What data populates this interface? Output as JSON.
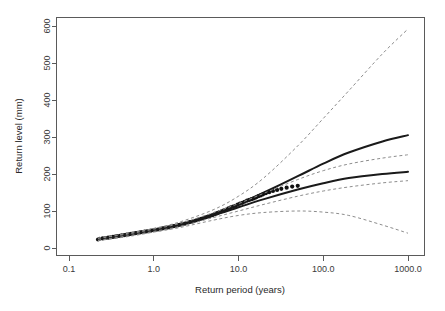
{
  "chart_data": {
    "type": "scatter",
    "title": "",
    "xlabel": "Return period (years)",
    "ylabel": "Return level (mm)",
    "xscale": "log",
    "yscale": "linear",
    "xlim": [
      0.1,
      1000.0
    ],
    "ylim": [
      0,
      620
    ],
    "xticks": [
      0.1,
      1.0,
      10.0,
      100.0,
      1000.0
    ],
    "xticklabels": [
      "0.1",
      "1.0",
      "10.0",
      "100.0",
      "1000.0"
    ],
    "yticks": [
      0,
      100,
      200,
      300,
      400,
      500,
      600
    ],
    "yticklabels": [
      "0",
      "100",
      "200",
      "300",
      "400",
      "500",
      "600"
    ],
    "grid": false,
    "legend": null,
    "box": true,
    "series": [
      {
        "name": "Empirical return levels",
        "type": "scatter",
        "marker": "filled-circle",
        "color": "#101010",
        "points": [
          [
            0.22,
            23
          ],
          [
            0.23,
            25
          ],
          [
            0.25,
            26
          ],
          [
            0.27,
            27
          ],
          [
            0.29,
            28
          ],
          [
            0.31,
            29
          ],
          [
            0.33,
            30
          ],
          [
            0.35,
            31
          ],
          [
            0.37,
            32
          ],
          [
            0.4,
            33
          ],
          [
            0.42,
            34
          ],
          [
            0.45,
            35
          ],
          [
            0.48,
            36
          ],
          [
            0.51,
            37
          ],
          [
            0.54,
            38
          ],
          [
            0.57,
            39
          ],
          [
            0.61,
            40
          ],
          [
            0.65,
            41
          ],
          [
            0.69,
            42
          ],
          [
            0.73,
            43
          ],
          [
            0.78,
            44
          ],
          [
            0.83,
            45
          ],
          [
            0.88,
            46
          ],
          [
            0.93,
            47
          ],
          [
            0.99,
            48
          ],
          [
            1.05,
            49
          ],
          [
            1.12,
            50
          ],
          [
            1.19,
            51
          ],
          [
            1.27,
            53
          ],
          [
            1.35,
            54
          ],
          [
            1.43,
            55
          ],
          [
            1.52,
            56
          ],
          [
            1.62,
            58
          ],
          [
            1.72,
            59
          ],
          [
            1.83,
            60
          ],
          [
            1.95,
            62
          ],
          [
            2.07,
            63
          ],
          [
            2.2,
            65
          ],
          [
            2.34,
            66
          ],
          [
            2.49,
            68
          ],
          [
            2.65,
            70
          ],
          [
            2.82,
            71
          ],
          [
            3.0,
            73
          ],
          [
            3.19,
            75
          ],
          [
            3.4,
            77
          ],
          [
            3.62,
            79
          ],
          [
            3.85,
            81
          ],
          [
            4.1,
            83
          ],
          [
            4.36,
            85
          ],
          [
            4.64,
            87
          ],
          [
            4.94,
            89
          ],
          [
            5.25,
            92
          ],
          [
            5.59,
            94
          ],
          [
            5.95,
            97
          ],
          [
            6.33,
            99
          ],
          [
            6.74,
            102
          ],
          [
            7.17,
            104
          ],
          [
            7.63,
            107
          ],
          [
            8.12,
            110
          ],
          [
            8.64,
            112
          ],
          [
            9.2,
            114
          ],
          [
            9.79,
            117
          ],
          [
            10.4,
            120
          ],
          [
            11.1,
            122
          ],
          [
            11.8,
            125
          ],
          [
            12.6,
            128
          ],
          [
            13.4,
            130
          ],
          [
            14.3,
            132
          ],
          [
            15.2,
            134
          ],
          [
            16.2,
            137
          ],
          [
            17.2,
            140
          ],
          [
            18.3,
            142
          ],
          [
            19.5,
            145
          ],
          [
            21.0,
            148
          ],
          [
            23.0,
            151
          ],
          [
            25.5,
            154
          ],
          [
            28.5,
            157
          ],
          [
            32.0,
            160
          ],
          [
            37.0,
            163
          ],
          [
            43.0,
            166
          ],
          [
            50.0,
            168
          ]
        ]
      },
      {
        "name": "Fitted return level (model A)",
        "type": "line",
        "style": "solid",
        "color": "#1a1a1a",
        "points": [
          [
            0.22,
            24
          ],
          [
            0.5,
            36
          ],
          [
            1.0,
            48
          ],
          [
            2.0,
            62
          ],
          [
            5.0,
            90
          ],
          [
            10.0,
            118
          ],
          [
            20.0,
            150
          ],
          [
            50.0,
            194
          ],
          [
            100.0,
            228
          ],
          [
            200.0,
            258
          ],
          [
            500.0,
            288
          ],
          [
            1000.0,
            305
          ]
        ]
      },
      {
        "name": "Fitted return level (model B)",
        "type": "line",
        "style": "solid",
        "color": "#1a1a1a",
        "points": [
          [
            0.22,
            24
          ],
          [
            0.5,
            36
          ],
          [
            1.0,
            48
          ],
          [
            2.0,
            62
          ],
          [
            5.0,
            88
          ],
          [
            10.0,
            110
          ],
          [
            20.0,
            132
          ],
          [
            50.0,
            158
          ],
          [
            100.0,
            175
          ],
          [
            200.0,
            189
          ],
          [
            500.0,
            200
          ],
          [
            1000.0,
            206
          ]
        ]
      },
      {
        "name": "Upper confidence limit (outer)",
        "type": "line",
        "style": "dashed",
        "color": "#8d8d8d",
        "points": [
          [
            0.22,
            27
          ],
          [
            0.5,
            40
          ],
          [
            1.0,
            53
          ],
          [
            2.0,
            70
          ],
          [
            5.0,
            103
          ],
          [
            10.0,
            140
          ],
          [
            20.0,
            190
          ],
          [
            50.0,
            276
          ],
          [
            100.0,
            350
          ],
          [
            200.0,
            425
          ],
          [
            500.0,
            525
          ],
          [
            1000.0,
            592
          ]
        ]
      },
      {
        "name": "Upper confidence limit (inner)",
        "type": "line",
        "style": "dashed",
        "color": "#8d8d8d",
        "points": [
          [
            0.22,
            26
          ],
          [
            0.5,
            38
          ],
          [
            1.0,
            51
          ],
          [
            2.0,
            66
          ],
          [
            5.0,
            95
          ],
          [
            10.0,
            120
          ],
          [
            20.0,
            148
          ],
          [
            50.0,
            185
          ],
          [
            100.0,
            209
          ],
          [
            200.0,
            227
          ],
          [
            500.0,
            243
          ],
          [
            1000.0,
            252
          ]
        ]
      },
      {
        "name": "Lower confidence limit (inner)",
        "type": "line",
        "style": "dashed",
        "color": "#8d8d8d",
        "points": [
          [
            0.22,
            21
          ],
          [
            0.5,
            33
          ],
          [
            1.0,
            45
          ],
          [
            2.0,
            58
          ],
          [
            5.0,
            82
          ],
          [
            10.0,
            100
          ],
          [
            20.0,
            118
          ],
          [
            50.0,
            140
          ],
          [
            100.0,
            154
          ],
          [
            200.0,
            165
          ],
          [
            500.0,
            176
          ],
          [
            1000.0,
            182
          ]
        ]
      },
      {
        "name": "Lower confidence limit (outer)",
        "type": "line",
        "style": "dashed",
        "color": "#8d8d8d",
        "points": [
          [
            0.22,
            20
          ],
          [
            0.5,
            31
          ],
          [
            1.0,
            43
          ],
          [
            2.0,
            55
          ],
          [
            5.0,
            75
          ],
          [
            10.0,
            88
          ],
          [
            20.0,
            96
          ],
          [
            50.0,
            100
          ],
          [
            100.0,
            97
          ],
          [
            200.0,
            88
          ],
          [
            500.0,
            62
          ],
          [
            1000.0,
            40
          ]
        ]
      }
    ]
  },
  "axes": {
    "x_title": "Return period (years)",
    "y_title": "Return level (mm)",
    "x_tick_labels": [
      "0.1",
      "1.0",
      "10.0",
      "100.0",
      "1000.0"
    ],
    "y_tick_labels": [
      "0",
      "100",
      "200",
      "300",
      "400",
      "500",
      "600"
    ]
  },
  "colors": {
    "background": "#ffffff",
    "axis": "#5a5a5a",
    "fit_line": "#1a1a1a",
    "confidence_line": "#8d8d8d",
    "point": "#101010"
  }
}
